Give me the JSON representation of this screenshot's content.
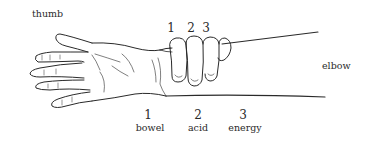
{
  "figure": {
    "labels": {
      "thumb": "thumb",
      "elbow": "elbow"
    },
    "finger_numbers": [
      "1",
      "2",
      "3"
    ],
    "positions": [
      {
        "number": "1",
        "name": "bowel"
      },
      {
        "number": "2",
        "name": "acid"
      },
      {
        "number": "3",
        "name": "energy"
      }
    ],
    "colors": {
      "ink": "#2a2a2a",
      "background": "#ffffff"
    }
  }
}
